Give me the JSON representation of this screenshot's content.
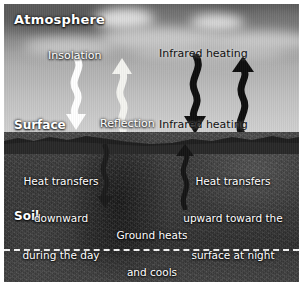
{
  "figure": {
    "type": "diagram"
  },
  "zones": {
    "atmosphere_label": "Atmosphere",
    "surface_label": "Surface",
    "soil_label": "Soil"
  },
  "sky_labels": {
    "insolation": "Insolation",
    "reflection": "Reflection",
    "infrared_heating_top": "Infrared heating",
    "infrared_heating_bottom": "Infrared heating"
  },
  "soil_labels": {
    "left_line1": "Heat transfers",
    "left_line2": "downward",
    "left_line3": "during the day",
    "center_line1": "Ground heats",
    "center_line2": "and cools",
    "center_line3": "by conduction",
    "right_line1": "Heat transfers",
    "right_line2": "upward toward the",
    "right_line3": "surface at night"
  },
  "arrows": [
    {
      "name": "insolation-arrow",
      "direction": "down",
      "color": "#ffffff",
      "region": "sky"
    },
    {
      "name": "reflection-arrow",
      "direction": "up",
      "color": "#f2f2ee",
      "region": "sky"
    },
    {
      "name": "infrared-down-arrow",
      "direction": "down",
      "color": "#101010",
      "region": "sky"
    },
    {
      "name": "infrared-up-arrow",
      "direction": "up",
      "color": "#101010",
      "region": "sky"
    },
    {
      "name": "soil-conduction-down-arrow",
      "direction": "down",
      "color": "#1c1c1c",
      "region": "soil"
    },
    {
      "name": "soil-conduction-up-arrow",
      "direction": "up",
      "color": "#1c1c1c",
      "region": "soil"
    }
  ],
  "colors": {
    "sky_top": "#6f6f6f",
    "sky_bottom": "#d2d2d2",
    "soil": "#3a3a3a",
    "label_text": "#ffffff",
    "dashed_line": "#f2f2f2",
    "dark_arrow": "#101010",
    "light_arrow": "#ffffff"
  }
}
